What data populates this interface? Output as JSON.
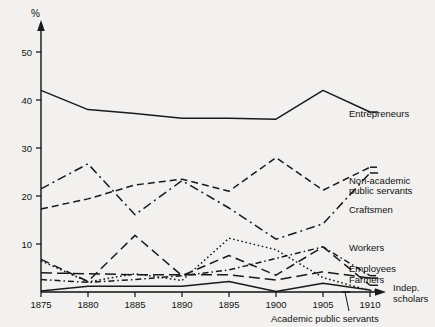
{
  "chart_data": {
    "type": "line",
    "title": "",
    "subtitle": "",
    "xlabel": "",
    "ylabel": "%",
    "unit_symbol": "%",
    "x": [
      1875,
      1880,
      1885,
      1890,
      1895,
      1900,
      1905,
      1910
    ],
    "xtick_labels": [
      "1875",
      "1880",
      "1885",
      "1890",
      "1895",
      "1900",
      "1905",
      "1910"
    ],
    "ytick_labels": [
      "10",
      "20",
      "30",
      "40",
      "50"
    ],
    "ytick_values": [
      10,
      20,
      30,
      40,
      50
    ],
    "xlim": [
      1875,
      1910
    ],
    "ylim": [
      0,
      55
    ],
    "grid": false,
    "legend_position": "right-inline-labels",
    "series": [
      {
        "name": "Entrepreneurs",
        "style": "solid",
        "label_anchor": {
          "x": 1910,
          "y": 37.5
        },
        "values": [
          42.0,
          38.0,
          37.2,
          36.2,
          36.2,
          36.0,
          42.0,
          37.5
        ]
      },
      {
        "name": "Non-academic public servants",
        "style": "dashed",
        "label_anchor": {
          "x": 1910,
          "y": 26.0
        },
        "values": [
          17.3,
          19.4,
          22.3,
          23.5,
          21.0,
          28.0,
          21.2,
          26.0
        ]
      },
      {
        "name": "Craftsmen",
        "style": "dash-dot",
        "label_anchor": {
          "x": 1910,
          "y": 24.8
        },
        "values": [
          21.5,
          26.7,
          16.1,
          23.2,
          17.5,
          11.0,
          14.2,
          24.8
        ]
      },
      {
        "name": "Workers",
        "style": "dash-dot-short",
        "label_anchor": {
          "x": 1910,
          "y": 3.4
        },
        "values": [
          2.6,
          2.0,
          2.6,
          3.4,
          4.6,
          7.0,
          9.4,
          3.4
        ]
      },
      {
        "name": "Employees",
        "style": "long-dash",
        "label_anchor": {
          "x": 1910,
          "y": 2.9
        },
        "values": [
          4.0,
          3.8,
          3.6,
          3.6,
          3.6,
          2.5,
          4.2,
          2.9
        ]
      },
      {
        "name": "Farmers",
        "style": "medium-dash",
        "label_anchor": {
          "x": 1910,
          "y": 1.4
        },
        "values": [
          6.8,
          2.2,
          11.8,
          3.4,
          7.6,
          3.5,
          9.4,
          1.4
        ]
      },
      {
        "name": "Indep. scholars",
        "style": "dotted",
        "label_anchor": {
          "x": 1910,
          "y": 0.3
        },
        "values": [
          6.5,
          2.1,
          3.8,
          2.4,
          11.2,
          8.8,
          3.0,
          0.3
        ]
      },
      {
        "name": "Academic public servants",
        "style": "solid-thin",
        "label_anchor": {
          "x": 1907,
          "y": 0.0
        },
        "values": [
          0.2,
          1.2,
          1.2,
          1.2,
          2.2,
          0.1,
          1.8,
          0.4
        ]
      }
    ],
    "annotations": [
      {
        "text": "Academic public servants",
        "points_to_x": 1906,
        "points_to_y": 0
      }
    ],
    "labels": {
      "entrepreneurs": "Entrepreneurs",
      "non_academic_line1": "Non-academic",
      "non_academic_line2": "public servants",
      "craftsmen": "Craftsmen",
      "workers": "Workers",
      "employees": "Employees",
      "farmers": "Farmers",
      "indep_line1": "Indep.",
      "indep_line2": "scholars",
      "academic_public_servants": "Academic public servants"
    }
  },
  "colors": {
    "background": "#f2f1ef",
    "ink": "#1a1a1a"
  }
}
